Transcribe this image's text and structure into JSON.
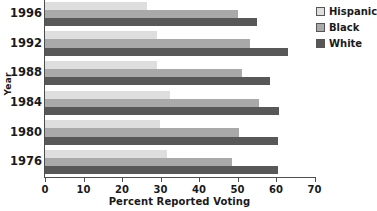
{
  "chart_data": {
    "type": "bar",
    "orientation": "horizontal",
    "title": "",
    "xlabel": "Percent Reported Voting",
    "ylabel": "Year",
    "categories": [
      "1996",
      "1992",
      "1988",
      "1984",
      "1980",
      "1976"
    ],
    "xlim": [
      0,
      70
    ],
    "xticks": [
      0,
      10,
      20,
      30,
      40,
      50,
      60,
      70
    ],
    "xtick_labels": [
      "0",
      "10",
      "20",
      "30",
      "40",
      "50",
      "60",
      "70"
    ],
    "grid": false,
    "legend_position": "right-top",
    "series": [
      {
        "name": "Hispanic",
        "color": "#dedede",
        "values": [
          26.4,
          29.0,
          29.0,
          32.4,
          29.9,
          31.8
        ]
      },
      {
        "name": "Black",
        "color": "#a9a9a9",
        "values": [
          50.0,
          53.3,
          51.1,
          55.7,
          50.4,
          48.7
        ]
      },
      {
        "name": "White",
        "color": "#585858",
        "values": [
          55.1,
          63.0,
          58.4,
          60.9,
          60.4,
          60.5
        ]
      }
    ]
  },
  "legend": {
    "items": [
      {
        "label": "Hispanic",
        "color": "#dedede"
      },
      {
        "label": "Black",
        "color": "#a9a9a9"
      },
      {
        "label": "White",
        "color": "#585858"
      }
    ]
  },
  "axes": {
    "x_title": "Percent Reported Voting",
    "y_title": "Year"
  }
}
